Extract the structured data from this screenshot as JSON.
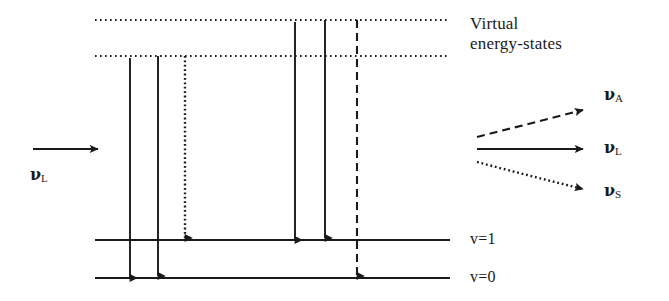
{
  "figure": {
    "type": "energy-level-diagram",
    "background_color": "#ffffff",
    "line_color": "#1a1a1a"
  },
  "virtual_states": {
    "caption_line1": "Virtual",
    "caption_line2": "energy-states",
    "levels": [
      {
        "name": "upper-virtual-level",
        "y": 20,
        "x_start": 95,
        "x_end": 450,
        "style": "dotted"
      },
      {
        "name": "lower-virtual-level",
        "y": 56,
        "x_start": 95,
        "x_end": 450,
        "style": "dotted"
      }
    ]
  },
  "vibrational_levels": [
    {
      "name": "v-equals-1",
      "label": "v=1",
      "y": 240,
      "x_start": 95,
      "x_end": 450,
      "style": "solid",
      "label_x": 470,
      "label_y": 232
    },
    {
      "name": "v-equals-0",
      "label": "v=0",
      "y": 278,
      "x_start": 95,
      "x_end": 450,
      "style": "solid",
      "label_x": 470,
      "label_y": 270
    }
  ],
  "incoming": {
    "label": "ν",
    "sub": "L",
    "arrow": {
      "x_start": 33,
      "x_end": 100,
      "y": 149,
      "style": "solid"
    },
    "label_x": 30,
    "label_y": 166
  },
  "transitions": [
    {
      "name": "stokes-excitation-up",
      "x": 130,
      "y_start": 278,
      "y_end": 56,
      "direction": "up",
      "style": "solid"
    },
    {
      "name": "rayleigh-emission-down-left",
      "x": 158,
      "y_start": 56,
      "y_end": 278,
      "direction": "down",
      "style": "solid"
    },
    {
      "name": "stokes-emission-down",
      "x": 185,
      "y_start": 56,
      "y_end": 240,
      "direction": "down",
      "style": "dotted"
    },
    {
      "name": "antistokes-excitation-up",
      "x": 295,
      "y_start": 240,
      "y_end": 20,
      "direction": "up",
      "style": "solid"
    },
    {
      "name": "rayleigh-emission-down-right",
      "x": 325,
      "y_start": 20,
      "y_end": 240,
      "direction": "down",
      "style": "solid"
    },
    {
      "name": "antistokes-emission-down",
      "x": 357,
      "y_start": 20,
      "y_end": 278,
      "direction": "down",
      "style": "dashed"
    }
  ],
  "scattered_outputs": [
    {
      "name": "anti-stokes-output",
      "label": "ν",
      "sub": "A",
      "style": "dashed",
      "x_start": 477,
      "y_start": 137,
      "x_end": 585,
      "y_end": 110,
      "label_x": 604,
      "label_y": 86
    },
    {
      "name": "rayleigh-output",
      "label": "ν",
      "sub": "L",
      "style": "solid",
      "x_start": 477,
      "y_start": 149,
      "x_end": 585,
      "y_end": 149,
      "label_x": 604,
      "label_y": 139
    },
    {
      "name": "stokes-output",
      "label": "ν",
      "sub": "S",
      "style": "dotted",
      "x_start": 477,
      "y_start": 162,
      "x_end": 585,
      "y_end": 190,
      "label_x": 604,
      "label_y": 182
    }
  ],
  "virtual_caption_position": {
    "x": 470,
    "y": 14
  }
}
